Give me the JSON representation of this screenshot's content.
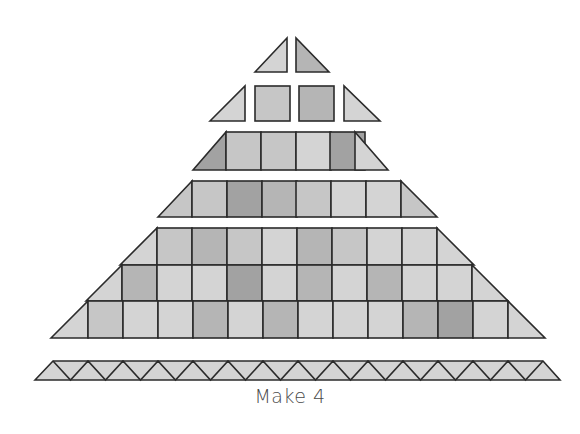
{
  "diagram": {
    "type": "quilt-assembly-diagram",
    "caption": "Make 4",
    "colors": {
      "outline": "#2b2b2b",
      "light": "#d4d4d4",
      "medium_light": "#c6c6c6",
      "medium": "#b5b5b5",
      "dark": "#a2a2a2"
    },
    "rows": [
      {
        "name": "row-1",
        "pieces": [
          {
            "kind": "triangle",
            "points": "255,72 287,38 287,72",
            "tone": "light"
          },
          {
            "kind": "triangle",
            "points": "296,38 296,72 329,72",
            "tone": "medium"
          }
        ]
      },
      {
        "name": "row-2",
        "pieces": [
          {
            "kind": "triangle",
            "points": "210,121 245,86 245,121",
            "tone": "light"
          },
          {
            "kind": "square",
            "x": 255,
            "y": 86,
            "w": 35,
            "h": 35,
            "tone": "medium_light"
          },
          {
            "kind": "square",
            "x": 299,
            "y": 86,
            "w": 35,
            "h": 35,
            "tone": "medium"
          },
          {
            "kind": "triangle",
            "points": "344,86 344,121 380,121",
            "tone": "light"
          }
        ]
      },
      {
        "name": "row-3",
        "y_top": 132,
        "y_bottom": 170,
        "left_edge": [
          193,
          226
        ],
        "right_edge": [
          355,
          388
        ],
        "square_x": [
          226,
          261,
          296,
          330
        ],
        "square_w": 35,
        "tones": [
          "dark",
          "medium_light",
          "medium_light",
          "light",
          "dark",
          "light"
        ]
      },
      {
        "name": "row-4",
        "y_top": 181,
        "y_bottom": 217,
        "left_edge": [
          158,
          192
        ],
        "right_edge": [
          401,
          437
        ],
        "square_x": [
          192,
          227,
          262,
          296,
          331,
          366
        ],
        "square_w": 35,
        "tones": [
          "medium_light",
          "medium_light",
          "dark",
          "medium",
          "medium_light",
          "light",
          "light",
          "medium_light"
        ]
      },
      {
        "name": "row-5",
        "y_top": 228,
        "y_bottom": 338,
        "bands": [
          {
            "y": 228,
            "h": 37,
            "x_start": 157,
            "count": 8,
            "tones": [
              "light",
              "medium_light",
              "medium",
              "medium_light",
              "light",
              "medium",
              "medium_light",
              "light",
              "light",
              "light"
            ]
          },
          {
            "y": 265,
            "h": 36,
            "x_start": 122,
            "count": 10,
            "tones": [
              "light",
              "medium",
              "light",
              "light",
              "dark",
              "light",
              "medium",
              "light",
              "medium",
              "light",
              "light",
              "light"
            ]
          },
          {
            "y": 301,
            "h": 37,
            "x_start": 88,
            "count": 12,
            "tones": [
              "light",
              "medium_light",
              "light",
              "light",
              "medium",
              "light",
              "medium",
              "light",
              "light",
              "light",
              "medium",
              "dark",
              "light",
              "light"
            ]
          }
        ],
        "square_w": 35
      },
      {
        "name": "sawtooth-strip",
        "y_top": 361,
        "y_bottom": 380,
        "x_left_bottom": 35,
        "x_left_top": 53,
        "x_right_top": 543,
        "x_right_bottom": 560,
        "tone": "light",
        "zigzag_count": 14
      }
    ]
  }
}
